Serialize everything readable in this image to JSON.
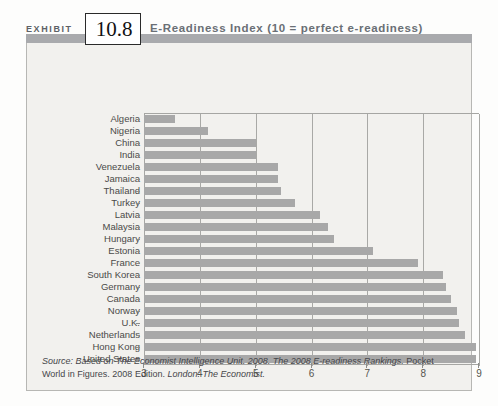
{
  "exhibit": {
    "label": "EXHIBIT",
    "number": "10.8",
    "title": "E-Readiness Index (10 = perfect e-readiness)"
  },
  "source": {
    "prefix": "Source:",
    "italic_1": "Based on The Economist Intelligence Unit. 2008. The 2008 E-readiness Rankings.",
    "plain_1": "Pocket World in Figures. 2008 Edition.",
    "italic_2": "London: The Economist.",
    "full_text": "Source: Based on The Economist Intelligence Unit. 2008. The 2008 E-readiness Rankings. Pocket World in Figures. 2008 Edition. London: The Economist."
  },
  "colors": {
    "bar": "#a8a8a8",
    "header_band": "#a9aaad",
    "panel_bg": "#f2f1ee",
    "grid": "#a9a9a6",
    "title_text": "#6a6f75"
  },
  "chart_data": {
    "type": "bar",
    "orientation": "horizontal",
    "title": "E-Readiness Index (10 = perfect e-readiness)",
    "xlabel": "",
    "ylabel": "",
    "xlim": [
      3,
      9
    ],
    "ylim": null,
    "grid": true,
    "legend": null,
    "xticks": [
      3,
      4,
      5,
      6,
      7,
      8,
      9
    ],
    "xtick_labels": [
      "3",
      "4",
      "5",
      "6",
      "7",
      "8",
      "9"
    ],
    "categories": [
      "Algeria",
      "Nigeria",
      "China",
      "India",
      "Venezuela",
      "Jamaica",
      "Thailand",
      "Turkey",
      "Latvia",
      "Malaysia",
      "Hungary",
      "Estonia",
      "France",
      "South Korea",
      "Germany",
      "Canada",
      "Norway",
      "U.K.",
      "Netherlands",
      "Hong Kong",
      "United States"
    ],
    "values": [
      3.55,
      4.15,
      5.0,
      5.0,
      5.4,
      5.4,
      5.45,
      5.7,
      6.15,
      6.3,
      6.4,
      7.1,
      7.9,
      8.35,
      8.4,
      8.5,
      8.6,
      8.65,
      8.75,
      8.95,
      8.95
    ]
  }
}
